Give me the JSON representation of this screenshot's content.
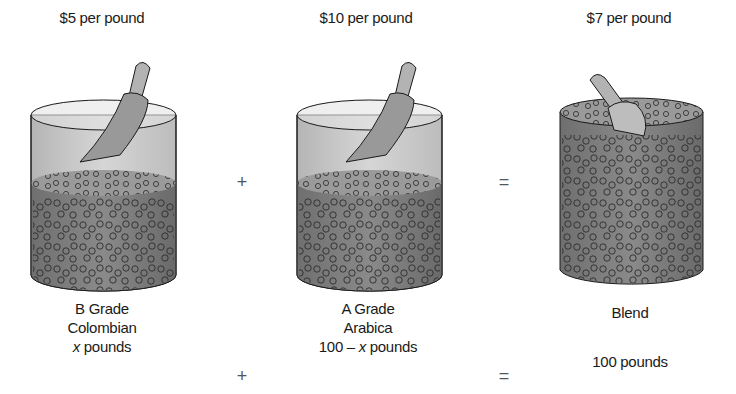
{
  "diagram": {
    "containers": [
      {
        "id": "colombian",
        "price_label": "$5 per pound",
        "name_lines": [
          "B Grade",
          "Colombian"
        ],
        "quantity_var": "x",
        "quantity_suffix": " pounds",
        "fill_level": "low"
      },
      {
        "id": "arabica",
        "price_label": "$10 per pound",
        "name_lines": [
          "A Grade",
          "Arabica"
        ],
        "quantity_prefix": "100 – ",
        "quantity_var": "x",
        "quantity_suffix": " pounds",
        "fill_level": "low"
      },
      {
        "id": "blend",
        "price_label": "$7 per pound",
        "name_lines": [
          "Blend"
        ],
        "quantity": "100 pounds",
        "fill_level": "full"
      }
    ],
    "operators": {
      "plus": "+",
      "equals": "="
    },
    "colors": {
      "glass": "#c9c9c9",
      "glass_rim": "#e6e6e6",
      "coffee": "#7d7d7d",
      "coffee_top": "#9a9a9a",
      "outline": "#1a1a1a",
      "scoop": "#a8a8a8"
    }
  }
}
